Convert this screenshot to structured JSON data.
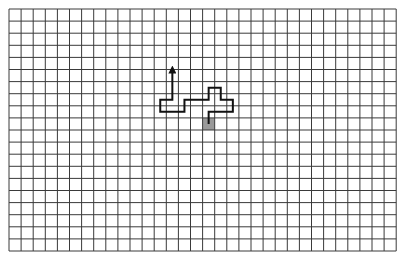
{
  "grid": {
    "cols": 32,
    "rows": 20,
    "origin_x": 9,
    "origin_y": 9,
    "cell_size": 12.1,
    "line_color": "#3a3a3a",
    "line_width": 1,
    "background": "#ffffff"
  },
  "start_cell": {
    "col": 16,
    "row": 9,
    "fill": "#9a9a9a"
  },
  "path": {
    "color": "#111111",
    "width": 2,
    "points_cell_centers": [
      [
        16,
        9
      ],
      [
        16,
        8
      ],
      [
        18,
        8
      ],
      [
        18,
        7
      ],
      [
        17,
        7
      ],
      [
        17,
        6
      ],
      [
        16,
        6
      ],
      [
        16,
        7
      ],
      [
        14,
        7
      ],
      [
        14,
        8
      ],
      [
        12,
        8
      ],
      [
        12,
        7
      ],
      [
        13,
        7
      ],
      [
        13,
        4.5
      ]
    ],
    "end_marker": "arrow-up"
  }
}
